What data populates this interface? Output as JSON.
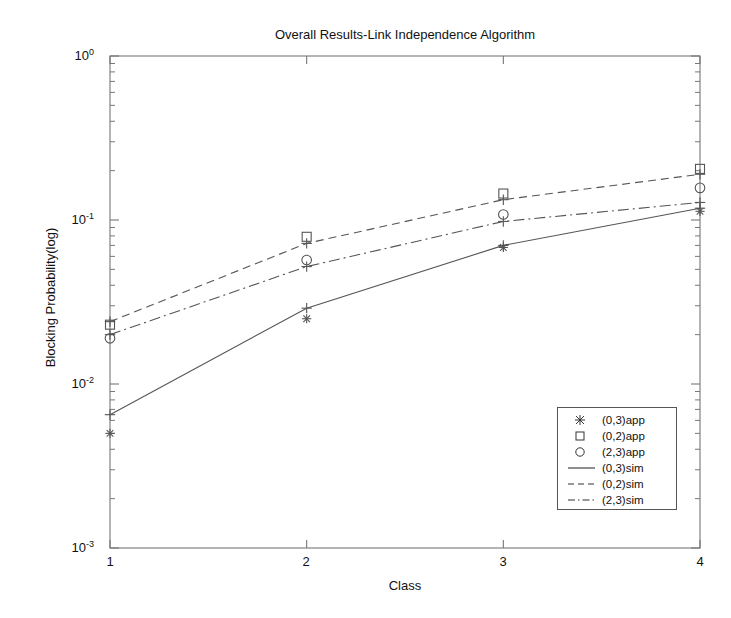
{
  "chart_data": {
    "type": "line",
    "title": "Overall Results-Link Independence Algorithm",
    "xlabel": "Class",
    "ylabel": "Blocking Probability(log)",
    "x": [
      1,
      2,
      3,
      4
    ],
    "xtick_labels": [
      "1",
      "2",
      "3",
      "4"
    ],
    "xlim": [
      1,
      4
    ],
    "ylim": [
      0.001,
      1
    ],
    "yscale": "log",
    "ytick_values": [
      1,
      0.1,
      0.01,
      0.001
    ],
    "ytick_labels": [
      "10^0",
      "10^-1",
      "10^-2",
      "10^-3"
    ],
    "grid": false,
    "legend_position": "lower right",
    "series": [
      {
        "name": "(0,3)app",
        "marker": "star",
        "style": "markers",
        "values": [
          0.005,
          0.025,
          0.068,
          0.113
        ]
      },
      {
        "name": "(0,2)app",
        "marker": "square",
        "style": "markers",
        "values": [
          0.023,
          0.079,
          0.145,
          0.205
        ]
      },
      {
        "name": "(2,3)app",
        "marker": "circle",
        "style": "markers",
        "values": [
          0.019,
          0.057,
          0.108,
          0.157
        ]
      },
      {
        "name": "(0,3)sim",
        "marker": "plus",
        "style": "solid",
        "values": [
          0.0065,
          0.029,
          0.07,
          0.118
        ]
      },
      {
        "name": "(0,2)sim",
        "marker": "plus",
        "style": "dashed",
        "values": [
          0.024,
          0.072,
          0.133,
          0.19
        ]
      },
      {
        "name": "(2,3)sim",
        "marker": "plus",
        "style": "dashdot",
        "values": [
          0.02,
          0.052,
          0.098,
          0.128
        ]
      }
    ]
  },
  "ticks": {
    "x": [
      {
        "label": "1"
      },
      {
        "label": "2"
      },
      {
        "label": "3"
      },
      {
        "label": "4"
      }
    ],
    "y": [
      {
        "base": "10",
        "exp": "0"
      },
      {
        "base": "10",
        "exp": "-1"
      },
      {
        "base": "10",
        "exp": "-2"
      },
      {
        "base": "10",
        "exp": "-3"
      }
    ]
  },
  "legend": {
    "items": [
      {
        "label": "(0,3)app",
        "sample": "star-marker"
      },
      {
        "label": "(0,2)app",
        "sample": "square-marker"
      },
      {
        "label": "(2,3)app",
        "sample": "circle-marker"
      },
      {
        "label": "(0,3)sim",
        "sample": "solid-line"
      },
      {
        "label": "(0,2)sim",
        "sample": "dashed-line"
      },
      {
        "label": "(2,3)sim",
        "sample": "dashdot-line"
      }
    ]
  },
  "colors": {
    "line": "#555555",
    "axis": "#777777",
    "text": "#111111",
    "background": "#ffffff"
  }
}
